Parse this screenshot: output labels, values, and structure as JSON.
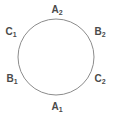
{
  "figure": {
    "background_color": "#ffffff",
    "width": 113,
    "height": 119
  },
  "circle": {
    "name": "circle-outline",
    "center_x": 56,
    "center_y": 57,
    "radius": 38,
    "stroke_color": "#8c8c8c",
    "stroke_width": 1,
    "fill": "none"
  },
  "labels": [
    {
      "id": "A2",
      "base": "A",
      "subscript": "2",
      "text": "A₂",
      "position": "top",
      "angle_deg": 90,
      "x": 57,
      "y": 10,
      "color": "#4a4a4a"
    },
    {
      "id": "B2",
      "base": "B",
      "subscript": "2",
      "text": "B₂",
      "position": "upper-right",
      "angle_deg": 30,
      "x": 100,
      "y": 32,
      "color": "#4a4a4a"
    },
    {
      "id": "C2",
      "base": "C",
      "subscript": "2",
      "text": "C₂",
      "position": "lower-right",
      "angle_deg": -30,
      "x": 100,
      "y": 79,
      "color": "#4a4a4a"
    },
    {
      "id": "A1",
      "base": "A",
      "subscript": "1",
      "text": "A₁",
      "position": "bottom",
      "angle_deg": -90,
      "x": 57,
      "y": 107,
      "color": "#4a4a4a"
    },
    {
      "id": "B1",
      "base": "B",
      "subscript": "1",
      "text": "B₁",
      "position": "lower-left",
      "angle_deg": -150,
      "x": 12,
      "y": 79,
      "color": "#4a4a4a"
    },
    {
      "id": "C1",
      "base": "C",
      "subscript": "1",
      "text": "C₁",
      "position": "upper-left",
      "angle_deg": 150,
      "x": 11,
      "y": 32,
      "color": "#4a4a4a"
    }
  ]
}
